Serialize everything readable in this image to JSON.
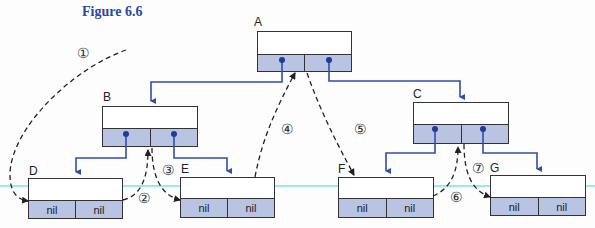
{
  "figure": {
    "title": "Figure 6.6"
  },
  "colors": {
    "pointer_line": "#2f4fa8",
    "node_bottom_fill": "#b8c4e2",
    "title": "#2b4a9c",
    "guide_line": "#7fe3f0"
  },
  "nodes": [
    {
      "id": "A",
      "label": "A",
      "left": "",
      "right": ""
    },
    {
      "id": "B",
      "label": "B",
      "left": "",
      "right": ""
    },
    {
      "id": "C",
      "label": "C",
      "left": "",
      "right": ""
    },
    {
      "id": "D",
      "label": "D",
      "left": "nil",
      "right": "nil"
    },
    {
      "id": "E",
      "label": "E",
      "left": "nil",
      "right": "nil"
    },
    {
      "id": "F",
      "label": "F",
      "left": "nil",
      "right": "nil"
    },
    {
      "id": "G",
      "label": "G",
      "left": "nil",
      "right": "nil"
    }
  ],
  "edges": [
    {
      "from": "A",
      "to": "B",
      "side": "left"
    },
    {
      "from": "A",
      "to": "C",
      "side": "right"
    },
    {
      "from": "B",
      "to": "D",
      "side": "left"
    },
    {
      "from": "B",
      "to": "E",
      "side": "right"
    },
    {
      "from": "C",
      "to": "F",
      "side": "left"
    },
    {
      "from": "C",
      "to": "G",
      "side": "right"
    }
  ],
  "traversal_steps": [
    {
      "label": "①",
      "description": "to D"
    },
    {
      "label": "②",
      "description": "D back to B"
    },
    {
      "label": "③",
      "description": "B to E"
    },
    {
      "label": "④",
      "description": "E back to A"
    },
    {
      "label": "⑤",
      "description": "A to F"
    },
    {
      "label": "⑥",
      "description": "F back to C"
    },
    {
      "label": "⑦",
      "description": "C to G"
    }
  ]
}
